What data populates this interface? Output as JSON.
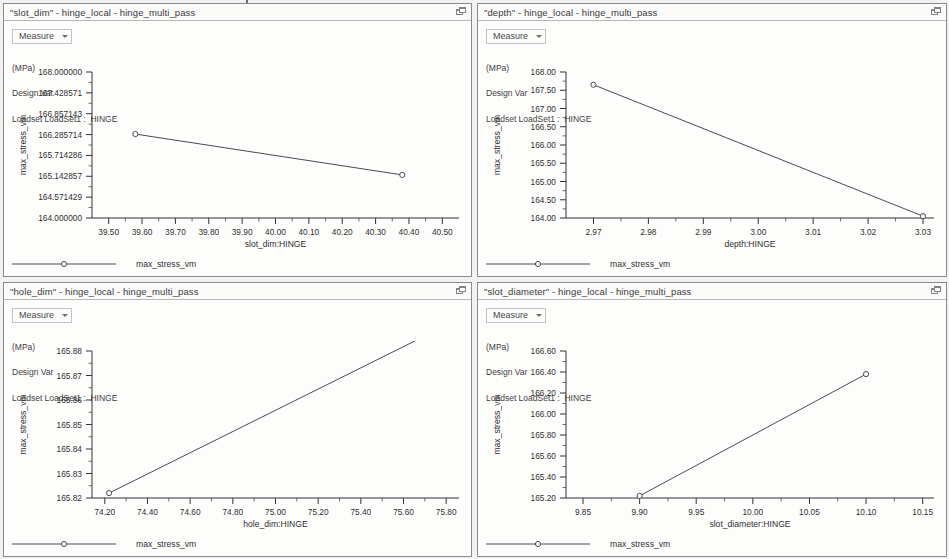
{
  "window": {
    "background_color": "#f2f2f0",
    "panel_background": "#fdfdfc",
    "series_color": "#4a4a52"
  },
  "panels": [
    {
      "title": "\"slot_dim\" - hinge_local - hinge_multi_pass",
      "restore_icon": "restore-window-icon",
      "measure_label": "Measure",
      "info": {
        "units": "(MPa)",
        "type": "Design Var",
        "loadset": "Loadset LoadSet1 :  HINGE"
      },
      "legend_label": "max_stress_vm",
      "chart_data": {
        "type": "line",
        "title": "\"slot_dim\" - hinge_local - hinge_multi_pass",
        "xlabel": "slot_dim:HINGE",
        "ylabel": "max_stress_vm",
        "units": "MPa",
        "x": [
          39.58,
          40.38
        ],
        "y": [
          166.3,
          165.18
        ],
        "xlim": [
          39.45,
          40.55
        ],
        "ylim": [
          164.0,
          168.0
        ],
        "xticks": [
          "39.50",
          "39.60",
          "39.70",
          "39.80",
          "39.90",
          "40.00",
          "40.10",
          "40.20",
          "40.30",
          "40.40",
          "40.50"
        ],
        "xtick_values": [
          39.5,
          39.6,
          39.7,
          39.8,
          39.9,
          40.0,
          40.1,
          40.2,
          40.3,
          40.4,
          40.5
        ],
        "yticks": [
          "168.000000",
          "167.428571",
          "166.857143",
          "166.285714",
          "165.714286",
          "165.142857",
          "164.571429",
          "164.000000"
        ],
        "ytick_values": [
          168.0,
          167.428571,
          166.857143,
          166.285714,
          165.714286,
          165.142857,
          164.571429,
          164.0
        ],
        "grid": false,
        "legend": [
          "max_stress_vm"
        ],
        "legend_position": "bottom-left"
      }
    },
    {
      "title": "\"depth\" - hinge_local - hinge_multi_pass",
      "restore_icon": "restore-window-icon",
      "measure_label": "Measure",
      "info": {
        "units": "(MPa)",
        "type": "Design Var",
        "loadset": "Loadset LoadSet1 :  HINGE"
      },
      "legend_label": "max_stress_vm",
      "chart_data": {
        "type": "line",
        "title": "\"depth\" - hinge_local - hinge_multi_pass",
        "xlabel": "depth:HINGE",
        "ylabel": "max_stress_vm",
        "units": "MPa",
        "x": [
          2.97,
          3.03
        ],
        "y": [
          167.65,
          164.05
        ],
        "xlim": [
          2.965,
          3.032
        ],
        "ylim": [
          164.0,
          168.0
        ],
        "xticks": [
          "2.97",
          "2.98",
          "2.99",
          "3.00",
          "3.01",
          "3.02",
          "3.03"
        ],
        "xtick_values": [
          2.97,
          2.98,
          2.99,
          3.0,
          3.01,
          3.02,
          3.03
        ],
        "yticks": [
          "168.00",
          "167.50",
          "167.00",
          "166.50",
          "166.00",
          "165.50",
          "165.00",
          "164.50",
          "164.00"
        ],
        "ytick_values": [
          168.0,
          167.5,
          167.0,
          166.5,
          166.0,
          165.5,
          165.0,
          164.5,
          164.0
        ],
        "grid": false,
        "legend": [
          "max_stress_vm"
        ],
        "legend_position": "bottom-left"
      }
    },
    {
      "title": "\"hole_dim\" - hinge_local - hinge_multi_pass",
      "restore_icon": "restore-window-icon",
      "measure_label": "Measure",
      "info": {
        "units": "(MPa)",
        "type": "Design Var",
        "loadset": "Loadset LoadSet1 :  HINGE"
      },
      "legend_label": "max_stress_vm",
      "chart_data": {
        "type": "line",
        "title": "\"hole_dim\" - hinge_local - hinge_multi_pass",
        "xlabel": "hole_dim:HINGE",
        "ylabel": "max_stress_vm",
        "units": "MPa",
        "x": [
          74.22,
          75.72
        ],
        "y": [
          165.822,
          165.887
        ],
        "xlim": [
          74.14,
          75.86
        ],
        "ylim": [
          165.82,
          165.88
        ],
        "xticks": [
          "74.20",
          "74.40",
          "74.60",
          "74.80",
          "75.00",
          "75.20",
          "75.40",
          "75.60",
          "75.80"
        ],
        "xtick_values": [
          74.2,
          74.4,
          74.6,
          74.8,
          75.0,
          75.2,
          75.4,
          75.6,
          75.8
        ],
        "yticks": [
          "165.88",
          "165.87",
          "165.86",
          "165.85",
          "165.84",
          "165.83",
          "165.82"
        ],
        "ytick_values": [
          165.88,
          165.87,
          165.86,
          165.85,
          165.84,
          165.83,
          165.82
        ],
        "grid": false,
        "legend": [
          "max_stress_vm"
        ],
        "legend_position": "bottom-left"
      }
    },
    {
      "title": "\"slot_diameter\" - hinge_local - hinge_multi_pass",
      "restore_icon": "restore-window-icon",
      "measure_label": "Measure",
      "info": {
        "units": "(MPa)",
        "type": "Design Var",
        "loadset": "Loadset LoadSet1 :  HINGE"
      },
      "legend_label": "max_stress_vm",
      "chart_data": {
        "type": "line",
        "title": "\"slot_diameter\" - hinge_local - hinge_multi_pass",
        "xlabel": "slot_diameter:HINGE",
        "ylabel": "max_stress_vm",
        "units": "MPa",
        "x": [
          9.9,
          10.1
        ],
        "y": [
          165.22,
          166.38
        ],
        "xlim": [
          9.835,
          10.16
        ],
        "ylim": [
          165.2,
          166.6
        ],
        "xticks": [
          "9.85",
          "9.90",
          "9.95",
          "10.00",
          "10.05",
          "10.10",
          "10.15"
        ],
        "xtick_values": [
          9.85,
          9.9,
          9.95,
          10.0,
          10.05,
          10.1,
          10.15
        ],
        "yticks": [
          "166.60",
          "166.40",
          "166.20",
          "166.00",
          "165.80",
          "165.60",
          "165.40",
          "165.20"
        ],
        "ytick_values": [
          166.6,
          166.4,
          166.2,
          166.0,
          165.8,
          165.6,
          165.4,
          165.2
        ],
        "grid": false,
        "legend": [
          "max_stress_vm"
        ],
        "legend_position": "bottom-left"
      }
    }
  ]
}
